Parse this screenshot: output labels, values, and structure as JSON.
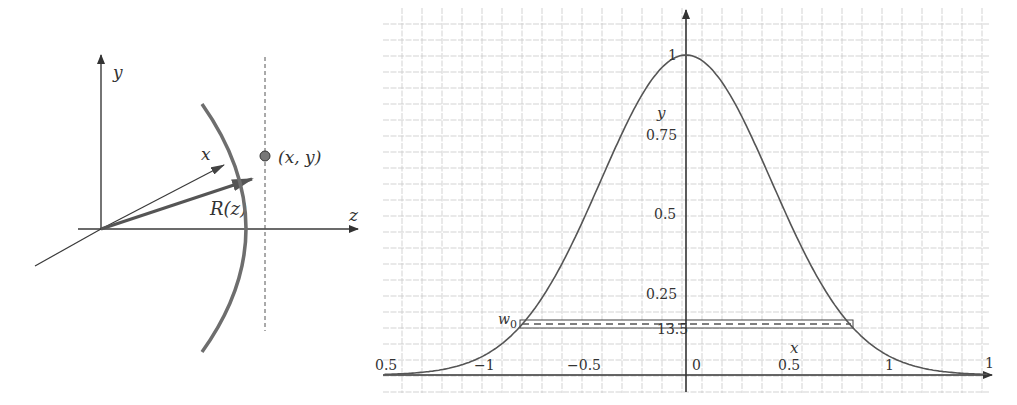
{
  "left_diagram": {
    "axis_labels": {
      "y": "y",
      "x": "x",
      "z": "z"
    },
    "vector_label": "R(z)",
    "point_label": "(x, y)",
    "colors": {
      "axis": "#3a3a3a",
      "wavefront": "#6e6e6e",
      "point": "#777777"
    }
  },
  "right_chart": {
    "y_axis_label": "y",
    "x_axis_label": "x",
    "y_ticks": [
      {
        "value": 1,
        "label": "1"
      },
      {
        "value": 0.75,
        "label": "0.75"
      },
      {
        "value": 0.5,
        "label": "0.5"
      },
      {
        "value": 0.25,
        "label": "0.25"
      }
    ],
    "x_ticks": [
      {
        "value": -1.5,
        "label": "0.5"
      },
      {
        "value": -1,
        "label": "−1"
      },
      {
        "value": -0.5,
        "label": "−0.5"
      },
      {
        "value": 0,
        "label": "0"
      },
      {
        "value": 0.5,
        "label": "0.5"
      },
      {
        "value": 1,
        "label": "1"
      },
      {
        "value": 1.5,
        "label": "1"
      }
    ],
    "band_label": "w0",
    "band_label_main": "w",
    "band_label_sub": "0",
    "band_value_label": "13.5",
    "colors": {
      "grid": "#c8c8c8",
      "axis": "#333333",
      "curve": "#555555"
    }
  },
  "chart_data": {
    "type": "line",
    "title": "",
    "xlabel": "x",
    "ylabel": "y",
    "xlim": [
      -1.5,
      1.5
    ],
    "ylim": [
      0,
      1.1
    ],
    "grid": true,
    "function": "y = exp(-4 ln2 x^2)",
    "series": [
      {
        "name": "Gaussian beam intensity profile",
        "x": [
          -1.5,
          -1.25,
          -1.0,
          -0.83,
          -0.75,
          -0.5,
          -0.25,
          0,
          0.25,
          0.5,
          0.75,
          0.83,
          1.0,
          1.25,
          1.5
        ],
        "y": [
          0.002,
          0.013,
          0.0625,
          0.148,
          0.21,
          0.5,
          0.84,
          1.0,
          0.84,
          0.5,
          0.21,
          0.148,
          0.0625,
          0.013,
          0.002
        ]
      }
    ],
    "annotations": [
      {
        "text": "w0",
        "x": -0.83,
        "y": 0.148
      },
      {
        "text": "13.5",
        "note": "band at 13.5% (1/e^2) level spanning x = -0.83 to 0.83"
      }
    ]
  }
}
